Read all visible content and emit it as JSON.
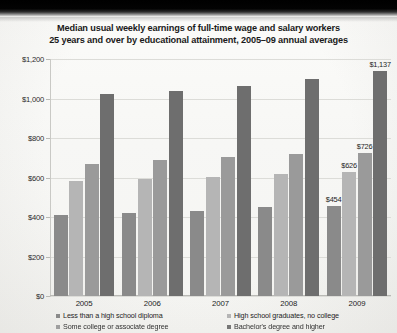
{
  "chart_data": {
    "type": "bar",
    "title": "Median usual weekly earnings of full-time wage and salary workers 25 years and over by educational attainment, 2005–09 annual averages",
    "title_line1": "Median usual weekly earnings of full-time wage and salary workers",
    "title_line2": "25 years and over by educational attainment, 2005–09 annual averages",
    "xlabel": "",
    "ylabel": "",
    "categories": [
      "2005",
      "2006",
      "2007",
      "2008",
      "2009"
    ],
    "ylim": [
      0,
      1200
    ],
    "ytick_values": [
      0,
      200,
      400,
      600,
      800,
      1000,
      1200
    ],
    "ytick_labels": [
      "$0",
      "$200",
      "$400",
      "$600",
      "$800",
      "$1,000",
      "$1,200"
    ],
    "grid": true,
    "legend_position": "bottom",
    "series": [
      {
        "name": "Less than a high school diploma",
        "color": "#8a8a8a",
        "values": [
          409,
          419,
          428,
          453,
          454
        ],
        "labels": [
          "",
          "",
          "",
          "",
          "$454"
        ]
      },
      {
        "name": "High school graduates, no college",
        "color": "#b5b5b5",
        "values": [
          583,
          595,
          604,
          618,
          626
        ],
        "labels": [
          "",
          "",
          "",
          "",
          "$626"
        ]
      },
      {
        "name": "Some college or associate degree",
        "color": "#9a9a9a",
        "values": [
          670,
          690,
          704,
          721,
          726
        ],
        "labels": [
          "",
          "",
          "",
          "",
          "$726"
        ]
      },
      {
        "name": "Bachelor's degree and higher",
        "color": "#6e6e6e",
        "values": [
          1023,
          1039,
          1064,
          1101,
          1137
        ],
        "labels": [
          "",
          "",
          "",
          "",
          "$1,137"
        ]
      }
    ]
  },
  "legend": {
    "items": [
      {
        "label": "Less than a high school diploma",
        "color": "#8a8a8a"
      },
      {
        "label": "High school graduates, no college",
        "color": "#b5b5b5"
      },
      {
        "label": "Some college or associate  degree",
        "color": "#9a9a9a"
      },
      {
        "label": "Bachelor's degree and higher",
        "color": "#6e6e6e"
      }
    ]
  }
}
